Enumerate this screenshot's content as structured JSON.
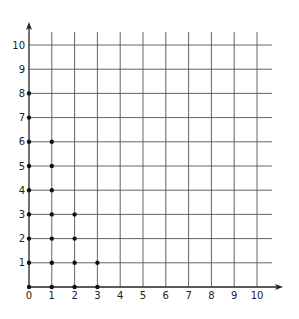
{
  "chart_data": {
    "type": "scatter",
    "title": "",
    "xlabel": "",
    "ylabel": "",
    "xlim": [
      0,
      10
    ],
    "ylim": [
      0,
      10
    ],
    "grid": true,
    "legend": null,
    "x_ticks": [
      "0",
      "1",
      "2",
      "3",
      "4",
      "5",
      "6",
      "7",
      "8",
      "9",
      "10"
    ],
    "y_ticks": [
      "1",
      "2",
      "3",
      "4",
      "5",
      "6",
      "7",
      "8",
      "9",
      "10"
    ],
    "series": [
      {
        "name": "lattice points",
        "points": [
          [
            0,
            0
          ],
          [
            0,
            1
          ],
          [
            0,
            2
          ],
          [
            0,
            3
          ],
          [
            0,
            4
          ],
          [
            0,
            5
          ],
          [
            0,
            6
          ],
          [
            0,
            7
          ],
          [
            0,
            8
          ],
          [
            1,
            0
          ],
          [
            1,
            1
          ],
          [
            1,
            2
          ],
          [
            1,
            3
          ],
          [
            1,
            4
          ],
          [
            1,
            5
          ],
          [
            1,
            6
          ],
          [
            2,
            0
          ],
          [
            2,
            1
          ],
          [
            2,
            2
          ],
          [
            2,
            3
          ],
          [
            3,
            0
          ],
          [
            3,
            1
          ]
        ]
      }
    ],
    "colors": {
      "grid": "#555555",
      "axis": "#222222",
      "point": "#111111",
      "background": "#ffffff"
    }
  }
}
